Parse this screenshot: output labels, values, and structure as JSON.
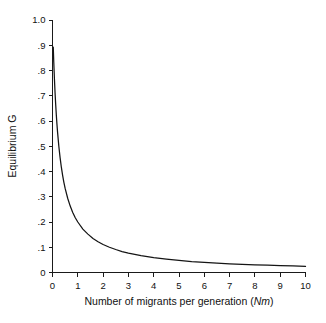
{
  "chart_data": {
    "type": "line",
    "title": "",
    "xlabel": "Number of migrants per generation (Nm)",
    "xlabel_plain": "Number of migrants per generation (",
    "xlabel_italic": "Nm",
    "xlabel_tail": ")",
    "ylabel": "Equilibrium G",
    "xlim": [
      0,
      10
    ],
    "ylim": [
      0,
      1.0
    ],
    "grid": false,
    "legend": "none",
    "formula": "G = 1 / (1 + 4Nm)",
    "line_color": "#141414",
    "axis_color": "#1a1a1a",
    "background_color": "#ffffff",
    "xticks": [
      0,
      1,
      2,
      3,
      4,
      5,
      6,
      7,
      8,
      9,
      10
    ],
    "xticklabels": [
      "0",
      "1",
      "2",
      "3",
      "4",
      "5",
      "6",
      "7",
      "8",
      "9",
      "10"
    ],
    "yticks": [
      0,
      0.1,
      0.2,
      0.3,
      0.4,
      0.5,
      0.6,
      0.7,
      0.8,
      0.9,
      1.0
    ],
    "yticklabels": [
      "0",
      ".1",
      ".2",
      ".3",
      ".4",
      ".5",
      ".6",
      ".7",
      ".8",
      ".9",
      "1.0"
    ],
    "series": [
      {
        "name": "Equilibrium G",
        "x": [
          0.03,
          0.05,
          0.075,
          0.1,
          0.125,
          0.15,
          0.175,
          0.2,
          0.25,
          0.3,
          0.35,
          0.4,
          0.45,
          0.5,
          0.6,
          0.7,
          0.8,
          0.9,
          1.0,
          1.2,
          1.4,
          1.6,
          1.8,
          2.0,
          2.25,
          2.5,
          2.75,
          3.0,
          3.5,
          4.0,
          4.5,
          5.0,
          5.5,
          6.0,
          6.5,
          7.0,
          7.5,
          8.0,
          8.5,
          9.0,
          9.5,
          10.0
        ],
        "y": [
          0.893,
          0.833,
          0.769,
          0.714,
          0.667,
          0.625,
          0.588,
          0.556,
          0.5,
          0.455,
          0.417,
          0.385,
          0.357,
          0.333,
          0.294,
          0.263,
          0.238,
          0.217,
          0.2,
          0.172,
          0.152,
          0.135,
          0.122,
          0.111,
          0.1,
          0.091,
          0.083,
          0.077,
          0.067,
          0.059,
          0.053,
          0.048,
          0.043,
          0.04,
          0.037,
          0.034,
          0.032,
          0.03,
          0.029,
          0.027,
          0.026,
          0.024
        ]
      }
    ]
  }
}
